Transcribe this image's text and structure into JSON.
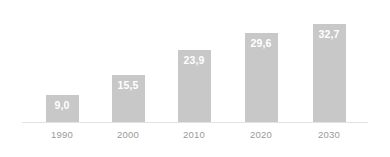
{
  "chart_data": {
    "type": "bar",
    "title": "",
    "subtitle": "",
    "xlabel": "",
    "ylabel": "",
    "categories": [
      "1990",
      "2000",
      "2010",
      "2020",
      "2030"
    ],
    "values": [
      9.0,
      15.5,
      23.9,
      29.6,
      32.7
    ],
    "value_labels": [
      "9,0",
      "15,5",
      "23,9",
      "29,6",
      "32,7"
    ],
    "ylim": [
      0,
      36
    ],
    "grid": false,
    "legend": false,
    "legend_position": "none",
    "bar_color": "#c8c8c8",
    "value_label_color": "#ffffff",
    "tick_label_color": "#9a9a9a",
    "axis_line_color": "#e2e2e2",
    "background_color": "#ffffff",
    "annotations": []
  },
  "bars": [
    {
      "category": "1990",
      "value": 9.0,
      "label": "9,0"
    },
    {
      "category": "2000",
      "value": 15.5,
      "label": "15,5"
    },
    {
      "category": "2010",
      "value": 23.9,
      "label": "23,9"
    },
    {
      "category": "2020",
      "value": 29.6,
      "label": "29,6"
    },
    {
      "category": "2030",
      "value": 32.7,
      "label": "32,7"
    }
  ]
}
